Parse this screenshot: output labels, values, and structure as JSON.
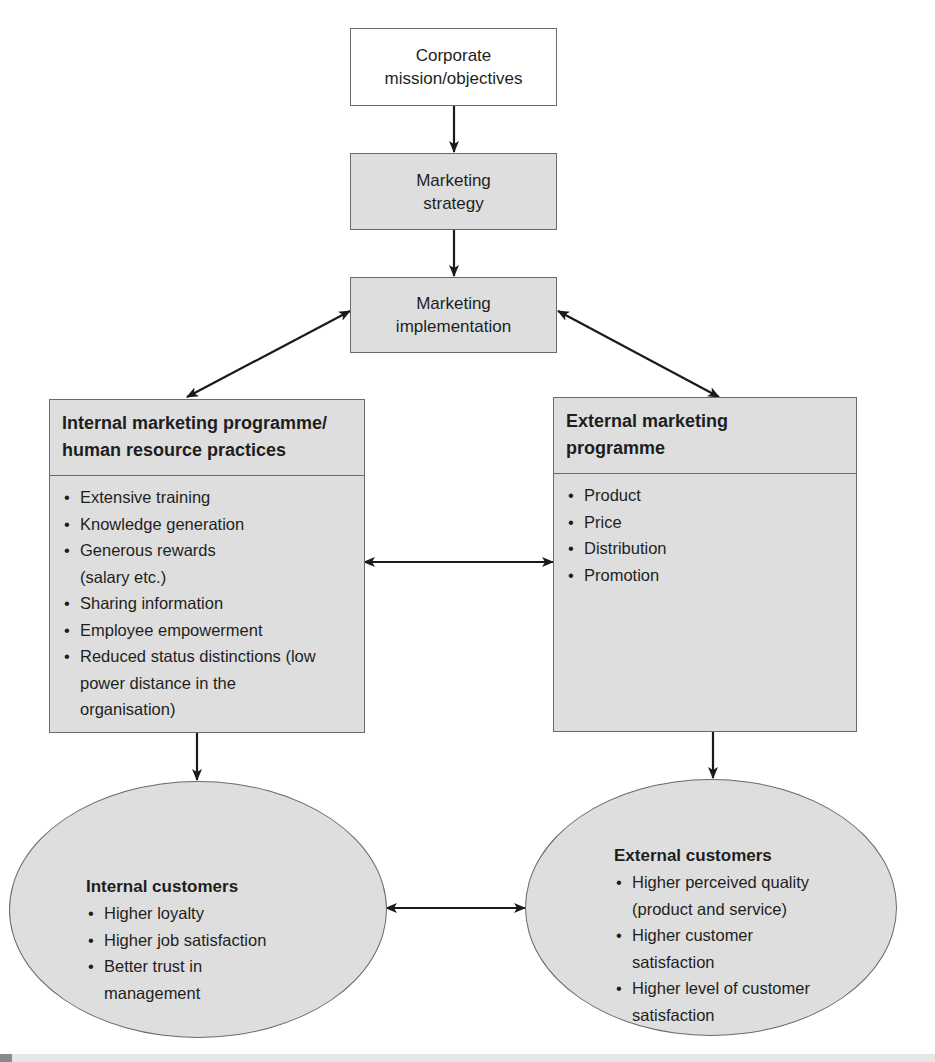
{
  "diagram": {
    "corporate": {
      "line1": "Corporate",
      "line2": "mission/objectives"
    },
    "strategy": {
      "line1": "Marketing",
      "line2": "strategy"
    },
    "implementation": {
      "line1": "Marketing",
      "line2": "implementation"
    },
    "internal_programme": {
      "title_line1": "Internal marketing programme/",
      "title_line2": "human resource practices",
      "items": [
        "Extensive training",
        "Knowledge generation",
        "Generous rewards (salary etc.)",
        "Sharing information",
        "Employee empowerment",
        "Reduced status distinctions (low power distance in the organisation)"
      ]
    },
    "external_programme": {
      "title_line1": "External marketing",
      "title_line2": "programme",
      "items": [
        "Product",
        "Price",
        "Distribution",
        "Promotion"
      ]
    },
    "internal_customers": {
      "title": "Internal customers",
      "items": [
        "Higher loyalty",
        "Higher job satisfaction",
        "Better trust in management"
      ]
    },
    "external_customers": {
      "title": "External customers",
      "items": [
        "Higher perceived quality (product and service)",
        "Higher customer satisfaction",
        "Higher level of customer satisfaction"
      ]
    },
    "colors": {
      "box_fill": "#dedede",
      "border": "#6a6a6a",
      "arrow": "#1a1a1a",
      "text": "#1e1e1e"
    }
  }
}
